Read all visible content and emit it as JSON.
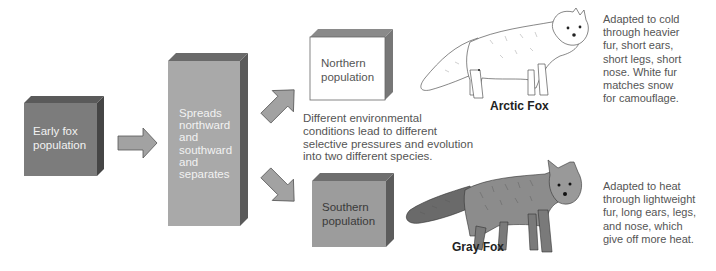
{
  "diagram": {
    "colors": {
      "dark_box_front": "#7a7a7a",
      "dark_box_top": "#5a5a5a",
      "dark_box_side": "#4a4a4a",
      "mid_box_front": "#a8a8a8",
      "mid_box_top": "#6a6a6a",
      "mid_box_side": "#5c5c5c",
      "light_box_front": "#ffffff",
      "south_box_front": "#9a9a9a",
      "arrow_fill": "#a0a0a0",
      "arrow_stroke": "#555555"
    },
    "boxes": {
      "early": {
        "label": "Early fox population",
        "lines": [
          "Early fox",
          "population"
        ]
      },
      "spread": {
        "label": "Spreads northward and southward and separates",
        "lines": [
          "Spreads",
          "northward",
          "and",
          "southward",
          "and",
          "separates"
        ]
      },
      "northern": {
        "label": "Northern population",
        "lines": [
          "Northern",
          "population"
        ]
      },
      "southern": {
        "label": "Southern population",
        "lines": [
          "Southern",
          "population"
        ]
      }
    },
    "center_text": {
      "lines": [
        "Different environmental",
        "conditions lead to different",
        "selective pressures and evolution",
        "into two different species."
      ]
    },
    "species": {
      "arctic": {
        "name": "Arctic Fox",
        "icon": "arctic-fox-illustration",
        "description_lines": [
          "Adapted to cold",
          "through heavier",
          "fur, short ears,",
          "short legs, short",
          "nose. White fur",
          "matches snow",
          "for camouflage."
        ]
      },
      "gray": {
        "name": "Gray Fox",
        "icon": "gray-fox-illustration",
        "description_lines": [
          "Adapted to heat",
          "through lightweight",
          "fur, long ears, legs,",
          "and nose, which",
          "give off more heat."
        ]
      }
    },
    "arrows": [
      {
        "name": "arrow-right",
        "direction": "right"
      },
      {
        "name": "arrow-up-right",
        "direction": "up-right"
      },
      {
        "name": "arrow-down-right",
        "direction": "down-right"
      }
    ]
  }
}
